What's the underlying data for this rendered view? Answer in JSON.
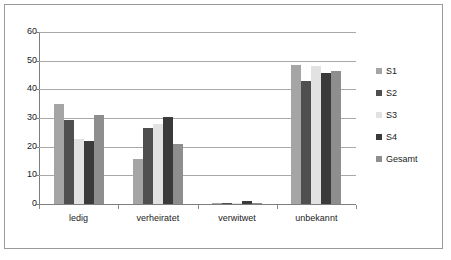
{
  "chart_data": {
    "type": "bar",
    "title": "",
    "subtitle": "",
    "xlabel": "",
    "ylabel": "",
    "categories": [
      "ledig",
      "verheiratet",
      "verwitwet",
      "unbekannt"
    ],
    "series": [
      {
        "name": "S1",
        "color": "#a5a5a5",
        "values": [
          35.0,
          15.7,
          0.2,
          48.5
        ]
      },
      {
        "name": "S2",
        "color": "#4f4f4f",
        "values": [
          29.4,
          26.5,
          0.4,
          43.0
        ]
      },
      {
        "name": "S3",
        "color": "#e2e2e2",
        "values": [
          22.8,
          27.9,
          0.2,
          48.1
        ]
      },
      {
        "name": "S4",
        "color": "#3a3a3a",
        "values": [
          22.0,
          30.3,
          1.2,
          45.8
        ]
      },
      {
        "name": "Gesamt",
        "color": "#8e8e8e",
        "values": [
          31.2,
          21.0,
          0.5,
          46.5
        ]
      }
    ],
    "ylim": [
      0,
      60
    ],
    "ytick_labels": [
      "60",
      "50",
      "40",
      "30",
      "20",
      "10",
      "0"
    ],
    "ytick_values": [
      60,
      50,
      40,
      30,
      20,
      10,
      0
    ],
    "ytick_step": 10,
    "grid": true,
    "grid_axis": "y",
    "legend_position": "right",
    "legend_entries": [
      "S1",
      "S2",
      "S3",
      "S4",
      "Gesamt"
    ],
    "border": true,
    "annotations": []
  },
  "colors": {
    "frame_border": "#9a9a9a",
    "gridline": "#a8a8a8",
    "axis_line": "#7d7d7d",
    "text": "#1b1b1b",
    "plot_background": "#ffffff"
  }
}
